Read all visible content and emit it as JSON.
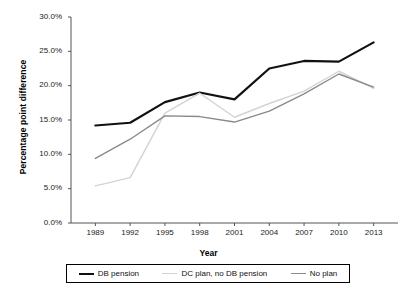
{
  "chart_data": {
    "type": "line",
    "title": "",
    "xlabel": "Year",
    "ylabel": "Percentage point difference",
    "categories": [
      "1989",
      "1992",
      "1995",
      "1998",
      "2001",
      "2004",
      "2007",
      "2010",
      "2013"
    ],
    "x": [
      1989,
      1992,
      1995,
      1998,
      2001,
      2004,
      2007,
      2010,
      2013
    ],
    "ylim": [
      0,
      30
    ],
    "yticks": [
      "0.0%",
      "5.0%",
      "10.0%",
      "15.0%",
      "20.0%",
      "25.0%",
      "30.0%"
    ],
    "ytick_values": [
      0,
      5,
      10,
      15,
      20,
      25,
      30
    ],
    "grid": false,
    "legend_position": "bottom",
    "series": [
      {
        "name": "DB pension",
        "color": "#111111",
        "width": 2.2,
        "values": [
          14.2,
          14.6,
          17.6,
          19.0,
          18.0,
          22.5,
          23.6,
          23.5,
          26.3
        ]
      },
      {
        "name": "DC plan, no DB pension",
        "color": "#d3d3d3",
        "width": 1.4,
        "values": [
          5.4,
          6.6,
          16.0,
          18.9,
          15.4,
          17.4,
          19.2,
          22.1,
          19.6
        ]
      },
      {
        "name": "No plan",
        "color": "#8a8a8a",
        "width": 1.4,
        "values": [
          9.4,
          12.2,
          15.6,
          15.5,
          14.7,
          16.3,
          18.8,
          21.7,
          19.8
        ]
      }
    ]
  },
  "axis": {
    "x_title": "Year",
    "y_title": "Percentage point difference"
  },
  "legend": {
    "items": [
      {
        "label": "DB pension"
      },
      {
        "label": "DC plan, no DB pension"
      },
      {
        "label": "No plan"
      }
    ]
  }
}
